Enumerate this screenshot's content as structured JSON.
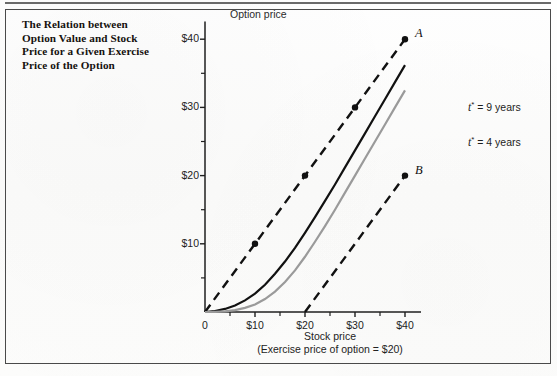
{
  "caption": {
    "lines": [
      "The Relation between",
      "Option Value and Stock",
      "Price for a Given Exercise",
      "Price of the Option"
    ]
  },
  "chart_data": {
    "type": "line",
    "title": "",
    "xlabel": "Stock price",
    "xlabel_note": "(Exercise price of option = $20)",
    "ylabel": "Option price",
    "xlim": [
      0,
      42
    ],
    "ylim": [
      0,
      42
    ],
    "grid": false,
    "legend_position": "right-inline",
    "x_tick_labels": [
      "0",
      "$10",
      "$20",
      "$30",
      "$40"
    ],
    "x_tick_values": [
      0,
      10,
      20,
      30,
      40
    ],
    "x_minor_tick_values": [
      5,
      15,
      25,
      35
    ],
    "y_tick_labels": [
      "$10",
      "$20",
      "$30",
      "$40"
    ],
    "y_tick_values": [
      10,
      20,
      30,
      40
    ],
    "y_minor_tick_values": [
      5,
      15,
      25,
      35
    ],
    "origin_label": "0",
    "series": [
      {
        "name": "upper-bound-line-A",
        "label": "A",
        "style": "dashed",
        "color": "#111111",
        "markers": [
          {
            "x": 10,
            "y": 10
          },
          {
            "x": 20,
            "y": 20
          },
          {
            "x": 30,
            "y": 30
          },
          {
            "x": 40,
            "y": 40
          }
        ],
        "x": [
          0,
          40
        ],
        "values": [
          0,
          40
        ]
      },
      {
        "name": "lower-bound-line-B",
        "label": "B",
        "style": "dashed",
        "color": "#111111",
        "markers": [
          {
            "x": 40,
            "y": 20
          }
        ],
        "x": [
          20,
          40
        ],
        "values": [
          0,
          20
        ]
      },
      {
        "name": "option-value-9-years",
        "label": "t* = 9 years",
        "label_var": "t",
        "label_sup": "*",
        "label_rest": " = 9 years",
        "style": "solid",
        "color": "#111111",
        "x": [
          0,
          2,
          4,
          6,
          8,
          10,
          12,
          14,
          16,
          18,
          20,
          22,
          24,
          26,
          28,
          30,
          32,
          34,
          36,
          38,
          40
        ],
        "values": [
          0,
          0.15,
          0.45,
          0.95,
          1.7,
          2.7,
          4.0,
          5.6,
          7.4,
          9.4,
          11.6,
          13.9,
          16.3,
          18.7,
          21.2,
          23.7,
          26.2,
          28.7,
          31.2,
          33.7,
          36.2
        ]
      },
      {
        "name": "option-value-4-years",
        "label": "t* = 4 years",
        "label_var": "t",
        "label_sup": "*",
        "label_rest": " = 4 years",
        "style": "solid",
        "color": "#9a9a9a",
        "x": [
          0,
          2,
          4,
          6,
          8,
          10,
          12,
          14,
          16,
          18,
          20,
          22,
          24,
          26,
          28,
          30,
          32,
          34,
          36,
          38,
          40
        ],
        "values": [
          0,
          0.02,
          0.1,
          0.28,
          0.6,
          1.1,
          1.9,
          3.0,
          4.4,
          6.1,
          8.1,
          10.3,
          12.6,
          15.0,
          17.5,
          20.0,
          22.5,
          25.0,
          27.5,
          30.0,
          32.5
        ]
      }
    ]
  }
}
